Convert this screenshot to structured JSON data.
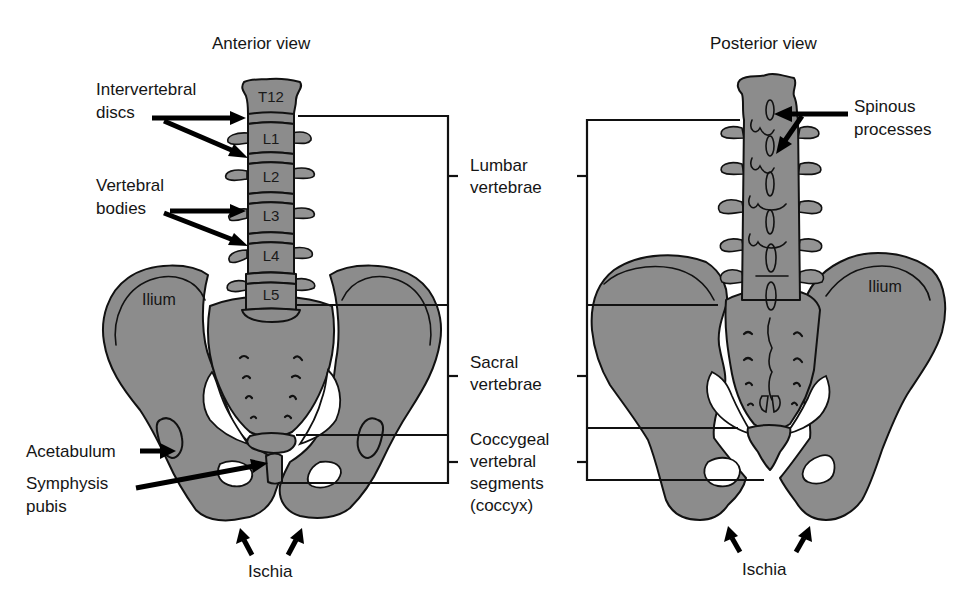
{
  "figure": {
    "anterior": {
      "title": "Anterior view",
      "vertebrae": [
        "T12",
        "L1",
        "L2",
        "L3",
        "L4",
        "L5"
      ],
      "labels": {
        "intervertebral_discs": [
          "Intervertebral",
          "discs"
        ],
        "vertebral_bodies": [
          "Vertebral",
          "bodies"
        ],
        "ilium": "Ilium",
        "acetabulum": "Acetabulum",
        "symphysis_pubis": [
          "Symphysis",
          "pubis"
        ],
        "ischia": "Ischia"
      }
    },
    "regions": {
      "lumbar": [
        "Lumbar",
        "vertebrae"
      ],
      "sacral": [
        "Sacral",
        "vertebrae"
      ],
      "coccygeal": [
        "Coccygeal",
        "vertebral",
        "segments",
        "(coccyx)"
      ]
    },
    "posterior": {
      "title": "Posterior view",
      "labels": {
        "spinous_processes": [
          "Spinous",
          "processes"
        ],
        "ilium": "Ilium",
        "ischia": "Ischia"
      }
    },
    "colors": {
      "bone": "#8c8c8c",
      "outline": "#111111",
      "background": "#ffffff"
    }
  }
}
